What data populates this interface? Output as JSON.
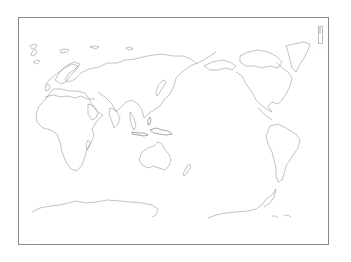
{
  "map": {
    "type": "blank world map outline",
    "projection_center": "Pacific-centered",
    "frame": {
      "border_color": "#8a8a8a"
    },
    "coast_color": "#9a9a9a",
    "regions_shown": [
      "Europe",
      "Africa",
      "Asia",
      "Australia",
      "North America",
      "South America",
      "Antarctica",
      "Greenland",
      "Japan",
      "Indonesia",
      "New Zealand"
    ]
  },
  "title_box": {
    "text": "白地図"
  },
  "scale_mark": {
    "text": "・・"
  },
  "credit": {
    "text": "- - - - -"
  }
}
